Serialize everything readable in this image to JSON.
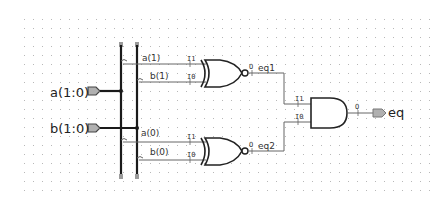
{
  "schematic": {
    "inputs": [
      {
        "name": "a(1:0)"
      },
      {
        "name": "b(1:0)"
      }
    ],
    "output": {
      "name": "eq"
    },
    "bus_taps": {
      "a1": "a(1)",
      "b1": "b(1)",
      "a0": "a(0)",
      "b0": "b(0)"
    },
    "gates": [
      {
        "type": "XNOR",
        "inputs": [
          "I1",
          "I0"
        ],
        "output": "O",
        "net": "eq1"
      },
      {
        "type": "XNOR",
        "inputs": [
          "I1",
          "I0"
        ],
        "output": "O",
        "net": "eq2"
      },
      {
        "type": "AND",
        "inputs": [
          "I1",
          "I0"
        ],
        "output": "O"
      }
    ],
    "pins": {
      "i1": "I1",
      "i0": "I0",
      "o": "O"
    }
  },
  "colors": {
    "wire": "#555555",
    "bus": "#1a1a1a",
    "port_fill": "#b0b0b0",
    "grid_dot": "#b8b8b8"
  }
}
